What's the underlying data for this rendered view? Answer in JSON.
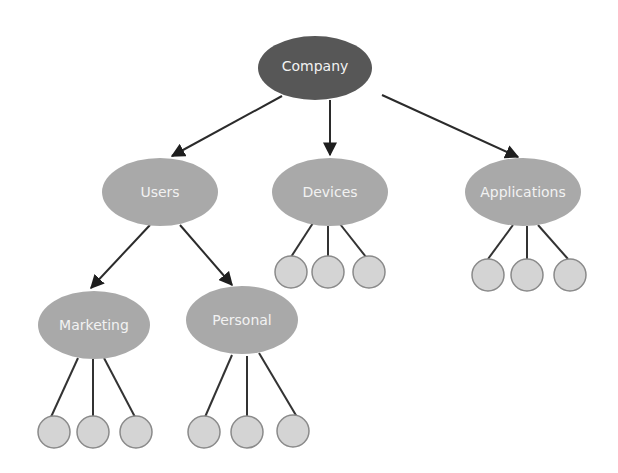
{
  "diagram": {
    "type": "tree",
    "colors": {
      "root_fill": "#575757",
      "node_fill": "#a9a9a9",
      "leaf_fill": "#d4d4d4",
      "leaf_stroke": "#8a8a8a",
      "edge": "#2b2b2b",
      "label": "#f2f2f2"
    },
    "root": {
      "label": "Company"
    },
    "level1": [
      {
        "label": "Users"
      },
      {
        "label": "Devices"
      },
      {
        "label": "Applications"
      }
    ],
    "level2": [
      {
        "label": "Marketing",
        "parent": "Users"
      },
      {
        "label": "Personal",
        "parent": "Users"
      }
    ],
    "leaf_groups": [
      {
        "parent": "Devices",
        "count": 3
      },
      {
        "parent": "Applications",
        "count": 3
      },
      {
        "parent": "Marketing",
        "count": 3
      },
      {
        "parent": "Personal",
        "count": 3
      }
    ]
  }
}
